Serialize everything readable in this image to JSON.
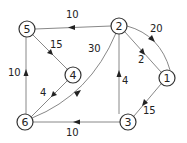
{
  "diagram": {
    "type": "directed weighted graph",
    "nodes": [
      {
        "id": "1",
        "label": "1",
        "x": 167,
        "y": 78
      },
      {
        "id": "2",
        "label": "2",
        "x": 119,
        "y": 26
      },
      {
        "id": "3",
        "label": "3",
        "x": 128,
        "y": 122
      },
      {
        "id": "4",
        "label": "4",
        "x": 73,
        "y": 75
      },
      {
        "id": "5",
        "label": "5",
        "x": 27,
        "y": 29
      },
      {
        "id": "6",
        "label": "6",
        "x": 25,
        "y": 122
      }
    ],
    "edges": [
      {
        "from": "2",
        "to": "5",
        "weight": "10"
      },
      {
        "from": "5",
        "to": "4",
        "weight": "15"
      },
      {
        "from": "6",
        "to": "5",
        "weight": "10"
      },
      {
        "from": "2",
        "to": "1",
        "weight": "20",
        "curved": true
      },
      {
        "from": "2",
        "to": "1",
        "weight": "2"
      },
      {
        "from": "3",
        "to": "2",
        "weight": "4"
      },
      {
        "from": "1",
        "to": "3",
        "weight": "15"
      },
      {
        "from": "3",
        "to": "6",
        "weight": "10"
      },
      {
        "from": "4",
        "to": "6",
        "weight": "4"
      },
      {
        "from": "6",
        "to": "2",
        "weight": "30",
        "curved": true
      }
    ]
  },
  "labels": {
    "n1": "1",
    "n2": "2",
    "n3": "3",
    "n4": "4",
    "n5": "5",
    "n6": "6",
    "w_2_5": "10",
    "w_5_4": "15",
    "w_6_5": "10",
    "w_2_1_curve": "20",
    "w_2_1": "2",
    "w_3_2": "4",
    "w_1_3": "15",
    "w_3_6": "10",
    "w_4_6": "4",
    "w_6_2": "30"
  },
  "colors": {
    "edge": "#888888",
    "node_stroke": "#333333",
    "text": "#222222"
  }
}
